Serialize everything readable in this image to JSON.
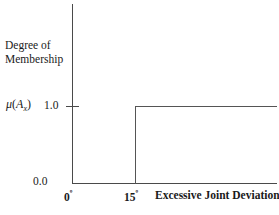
{
  "chart_data": {
    "type": "line",
    "title": "",
    "subtitle": "",
    "xlabel": "Excessive Joint Deviation",
    "ylabel": "Degree of Membership",
    "ylabel_line1": "Degree of",
    "ylabel_line2": "Membership",
    "mu_symbol": "μ",
    "mu_open_paren": "(",
    "mu_arg": "A",
    "mu_subscript": "x",
    "mu_close_paren": ")",
    "y_tick_labels": [
      "1.0",
      "0.0"
    ],
    "y_tick_values": [
      1.0,
      0.0
    ],
    "x_tick_labels": [
      "0",
      "15"
    ],
    "x_tick_degree_symbol": "º",
    "x_tick_values": [
      0,
      15
    ],
    "ylim": [
      0,
      1.0
    ],
    "xlim": [
      0,
      45
    ],
    "grid": false,
    "legend": false,
    "series": [
      {
        "name": "Excessive Joint Deviation membership",
        "shape": "step",
        "x": [
          0,
          15,
          15,
          45
        ],
        "values": [
          0.0,
          0.0,
          1.0,
          1.0
        ]
      }
    ],
    "annotations": [],
    "colors": {
      "axis": "#4a4a4a",
      "trace": "#555555",
      "background": "#ffffff",
      "text": "#1a1a1a"
    }
  }
}
